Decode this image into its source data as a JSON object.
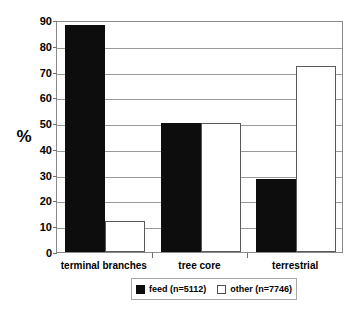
{
  "chart_data": {
    "type": "bar",
    "title": "",
    "subtitle": "",
    "xlabel": "",
    "ylabel": "%",
    "categories": [
      "terminal branches",
      "tree core",
      "terrestrial"
    ],
    "series": [
      {
        "name": "feed (n=5112)",
        "values": [
          88,
          50,
          28.5
        ],
        "color": "#0d0d0d"
      },
      {
        "name": "other (n=7746)",
        "values": [
          12,
          50,
          72
        ],
        "color": "#ffffff"
      }
    ],
    "ylim": [
      0,
      90
    ],
    "ytick_step": 10,
    "yticks": [
      90,
      80,
      70,
      60,
      50,
      40,
      30,
      20,
      10,
      0
    ],
    "ytick_labels": [
      "90",
      "80",
      "70",
      "60",
      "50",
      "40",
      "30",
      "20",
      "10",
      "0"
    ],
    "grid": true,
    "grid_axis": "y",
    "legend_position": "bottom-center",
    "legend_entries": [
      "feed (n=5112)",
      "other (n=7746)"
    ],
    "annotations": []
  },
  "colors": {
    "background": "#ffffff",
    "axis": "#8a8a8a",
    "gridline": "#9a9a9a",
    "text": "#000000",
    "feed_fill": "#0d0d0d",
    "other_fill": "#ffffff",
    "other_stroke": "#5a5a5a"
  }
}
